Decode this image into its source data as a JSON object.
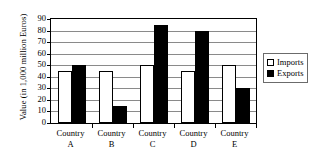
{
  "chart_data": {
    "type": "bar",
    "title": "",
    "xlabel": "",
    "ylabel": "Value (in 1,000 million Euros)",
    "categories": [
      "Country A",
      "Country B",
      "Country C",
      "Country D",
      "Country E"
    ],
    "category_lines": [
      {
        "line1": "Country",
        "line2": "A"
      },
      {
        "line1": "Country",
        "line2": "B"
      },
      {
        "line1": "Country",
        "line2": "C"
      },
      {
        "line1": "Country",
        "line2": "D"
      },
      {
        "line1": "Country",
        "line2": "E"
      }
    ],
    "series": [
      {
        "name": "Imports",
        "color": "#ffffff",
        "values": [
          45,
          45,
          50,
          45,
          50
        ]
      },
      {
        "name": "Exports",
        "color": "#000000",
        "values": [
          50,
          15,
          85,
          80,
          30
        ]
      }
    ],
    "ylim": [
      0,
      90
    ],
    "ytick_values": [
      0,
      10,
      20,
      30,
      40,
      50,
      60,
      70,
      80,
      90
    ],
    "ytick_labels": [
      "0",
      "10",
      "20",
      "30",
      "40",
      "50",
      "60",
      "70",
      "80",
      "90"
    ],
    "grid": true,
    "grid_axis": "y",
    "legend": {
      "position": "right",
      "entries": [
        {
          "label": "Imports",
          "swatch": "hollow-square-icon"
        },
        {
          "label": "Exports",
          "swatch": "filled-square-icon"
        }
      ]
    }
  }
}
